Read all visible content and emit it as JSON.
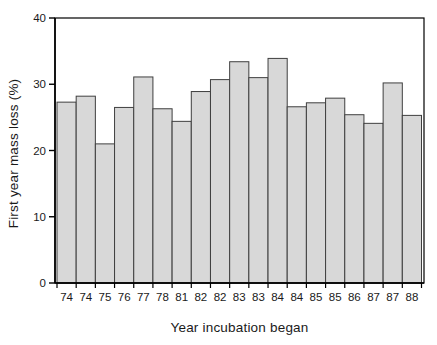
{
  "figure": {
    "background": "#ffffff",
    "text_color": "#1a1a1a"
  },
  "chart_data": {
    "type": "bar",
    "title": "",
    "xlabel": "Year incubation began",
    "ylabel": "First year mass loss (%)",
    "categories": [
      "74",
      "74",
      "75",
      "76",
      "77",
      "78",
      "81",
      "82",
      "82",
      "83",
      "83",
      "84",
      "84",
      "85",
      "85",
      "86",
      "87",
      "87",
      "88"
    ],
    "values": [
      27.3,
      28.2,
      21.0,
      26.5,
      31.1,
      26.3,
      24.4,
      28.9,
      30.7,
      33.4,
      31.0,
      33.9,
      26.6,
      27.2,
      27.9,
      25.4,
      24.1,
      30.2,
      25.3
    ],
    "ylim": [
      0,
      40
    ],
    "yticks": [
      0,
      10,
      20,
      30,
      40
    ],
    "grid": false,
    "legend": null,
    "bar_fill": "#d8d8d8",
    "bar_stroke": "#3f3f3f",
    "axis_color": "#000000",
    "tick_label_fontsize": 11.5
  }
}
